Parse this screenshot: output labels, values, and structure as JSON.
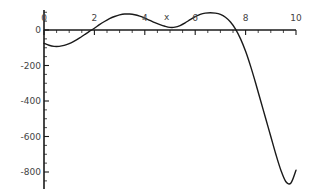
{
  "chart_data": {
    "type": "line",
    "title": "",
    "xlabel": "x",
    "ylabel": "",
    "xlim": [
      0,
      10
    ],
    "ylim": [
      -900,
      130
    ],
    "grid": false,
    "legend": null,
    "axis_style": "mathematica-crossing-axes",
    "x_ticks": [
      {
        "value": 0,
        "label": "0"
      },
      {
        "value": 2,
        "label": "2"
      },
      {
        "value": 4,
        "label": "4"
      },
      {
        "value": 6,
        "label": "6"
      },
      {
        "value": 8,
        "label": "8"
      },
      {
        "value": 10,
        "label": "10"
      }
    ],
    "y_ticks": [
      {
        "value": 0,
        "label": "0"
      },
      {
        "value": -200,
        "label": "-200"
      },
      {
        "value": -400,
        "label": "-400"
      },
      {
        "value": -600,
        "label": "-600"
      },
      {
        "value": -800,
        "label": "-800"
      }
    ],
    "x_minor_tick_step": 0.5,
    "y_minor_tick_step": 50,
    "series": [
      {
        "name": "curve",
        "color": "#1a1a1a",
        "x": [
          0.0,
          0.2,
          0.4,
          0.6,
          0.8,
          1.0,
          1.2,
          1.4,
          1.6,
          1.8,
          2.0,
          2.2,
          2.4,
          2.6,
          2.8,
          3.0,
          3.2,
          3.4,
          3.6,
          3.8,
          4.0,
          4.2,
          4.4,
          4.6,
          4.8,
          5.0,
          5.2,
          5.4,
          5.6,
          5.8,
          6.0,
          6.2,
          6.4,
          6.6,
          6.8,
          7.0,
          7.2,
          7.4,
          7.6,
          7.8,
          8.0,
          8.2,
          8.4,
          8.6,
          8.8,
          9.0,
          9.2,
          9.4,
          9.6,
          9.8,
          10.0
        ],
        "y": [
          -75,
          -86,
          -92,
          -92,
          -87,
          -77,
          -63,
          -46,
          -27,
          -8,
          10,
          30,
          48,
          64,
          76,
          85,
          90,
          90,
          86,
          78,
          67,
          54,
          41,
          30,
          21,
          15,
          16,
          25,
          40,
          58,
          75,
          88,
          95,
          97,
          95,
          88,
          72,
          45,
          5,
          -50,
          -120,
          -205,
          -300,
          -400,
          -500,
          -600,
          -700,
          -790,
          -855,
          -862,
          -790
        ]
      }
    ],
    "annotations": []
  },
  "figure": {
    "background": "#ffffff",
    "axis_color": "#1a1a1a",
    "tick_label_color": "#444444"
  }
}
